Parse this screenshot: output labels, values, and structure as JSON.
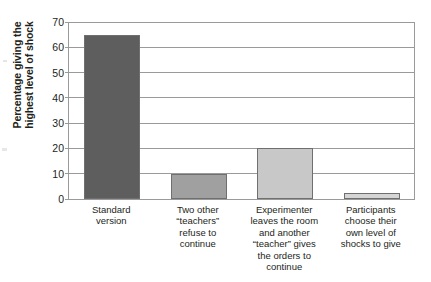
{
  "chart_data": {
    "type": "bar",
    "title": "",
    "xlabel": "",
    "ylabel": "Percentage giving the\nhighest level of shock",
    "ylim": [
      0,
      70
    ],
    "yticks": [
      0,
      10,
      20,
      30,
      40,
      50,
      60,
      70
    ],
    "ytick_labels": [
      "0",
      "10",
      "20",
      "30",
      "40",
      "50",
      "60",
      "70"
    ],
    "grid": true,
    "legend": "none",
    "categories": [
      "Standard\nversion",
      "Two other\n“teachers”\nrefuse to\ncontinue",
      "Experimenter\nleaves the room\nand another\n“teacher” gives\nthe orders to\ncontinue",
      "Participants\nchoose their\nown level of\nshocks to give"
    ],
    "values": [
      65,
      10,
      20,
      2.5
    ],
    "bar_colors": [
      "#5e5e5e",
      "#a0a0a0",
      "#c8c8c8",
      "#d5d5d5"
    ],
    "bar_border_color": "#6f6f6f",
    "axis_color": "#9a9a9a",
    "background": "#ffffff"
  }
}
